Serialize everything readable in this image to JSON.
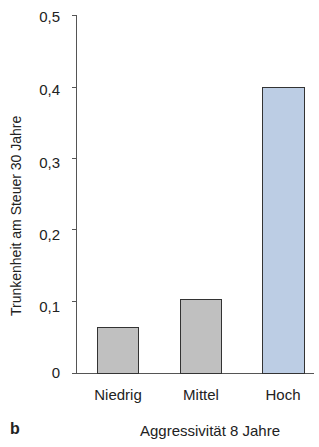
{
  "chart_data": {
    "type": "bar",
    "title": "",
    "panel_label": "b",
    "categories": [
      "Niedrig",
      "Mittel",
      "Hoch"
    ],
    "values": [
      0.065,
      0.105,
      0.4
    ],
    "colors": [
      "#c0c0c0",
      "#c0c0c0",
      "#bccde4"
    ],
    "xlabel": "Aggressivität 8 Jahre",
    "ylabel": "Trunkenheit am Steuer 30 Jahre",
    "ylim": [
      0,
      0.5
    ],
    "yticks": [
      "0",
      "0,1",
      "0,2",
      "0,3",
      "0,4",
      "0,5"
    ],
    "grid": false,
    "legend": null
  }
}
